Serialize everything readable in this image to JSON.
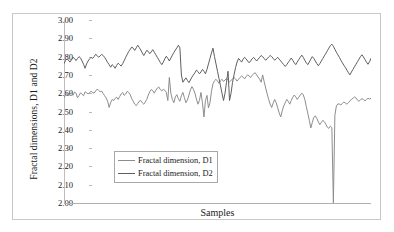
{
  "chart_data": {
    "type": "line",
    "title": "",
    "xlabel": "Samples",
    "ylabel": "Fractal dimensions, D1 and D2",
    "ylim": [
      2.0,
      3.0
    ],
    "ytick_step": 0.1,
    "ytick_labels": [
      "3.00",
      "2.90",
      "2.80",
      "2.70",
      "2.60",
      "2.50",
      "2.40",
      "2.30",
      "2.20",
      "2.10",
      "2.00"
    ],
    "ytick_values": [
      3.0,
      2.9,
      2.8,
      2.7,
      2.6,
      2.5,
      2.4,
      2.3,
      2.2,
      2.1,
      2.0
    ],
    "xtick_labels": [],
    "grid": false,
    "legend_position": "center-left-inside",
    "series": [
      {
        "name": "Fractal dimension, D1",
        "color": "#8d8d8d",
        "values": [
          2.575,
          2.592,
          2.598,
          2.586,
          2.596,
          2.603,
          2.589,
          2.606,
          2.6,
          2.575,
          2.588,
          2.602,
          2.594,
          2.586,
          2.608,
          2.602,
          2.596,
          2.604,
          2.61,
          2.604,
          2.6,
          2.612,
          2.622,
          2.616,
          2.608,
          2.612,
          2.598,
          2.586,
          2.574,
          2.556,
          2.522,
          2.548,
          2.566,
          2.56,
          2.572,
          2.578,
          2.566,
          2.582,
          2.596,
          2.604,
          2.588,
          2.596,
          2.61,
          2.604,
          2.592,
          2.57,
          2.556,
          2.54,
          2.532,
          2.544,
          2.556,
          2.56,
          2.548,
          2.54,
          2.552,
          2.566,
          2.59,
          2.608,
          2.62,
          2.614,
          2.6,
          2.616,
          2.628,
          2.634,
          2.62,
          2.612,
          2.622,
          2.616,
          2.604,
          2.56,
          2.686,
          2.6,
          2.566,
          2.548,
          2.58,
          2.592,
          2.57,
          2.556,
          2.586,
          2.604,
          2.576,
          2.548,
          2.562,
          2.59,
          2.618,
          2.636,
          2.622,
          2.6,
          2.568,
          2.54,
          2.56,
          2.604,
          2.548,
          2.47,
          2.56,
          2.588,
          2.52,
          2.548,
          2.61,
          2.652,
          2.668,
          2.676,
          2.666,
          2.654,
          2.668,
          2.676,
          2.664,
          2.672,
          2.68,
          2.67,
          2.662,
          2.67,
          2.678,
          2.686,
          2.678,
          2.666,
          2.676,
          2.686,
          2.694,
          2.688,
          2.678,
          2.69,
          2.7,
          2.694,
          2.686,
          2.698,
          2.706,
          2.712,
          2.7,
          2.688,
          2.676,
          2.66,
          2.7,
          2.664,
          2.628,
          2.596,
          2.566,
          2.54,
          2.522,
          2.546,
          2.566,
          2.548,
          2.52,
          2.492,
          2.47,
          2.504,
          2.53,
          2.548,
          2.566,
          2.556,
          2.54,
          2.56,
          2.578,
          2.59,
          2.58,
          2.566,
          2.578,
          2.59,
          2.6,
          2.592,
          2.566,
          2.528,
          2.49,
          2.452,
          2.41,
          2.44,
          2.468,
          2.476,
          2.462,
          2.444,
          2.428,
          2.44,
          2.452,
          2.444,
          2.43,
          2.414,
          2.408,
          2.42,
          2.412,
          2.0,
          2.48,
          2.53,
          2.542,
          2.54,
          2.536,
          2.544,
          2.552,
          2.546,
          2.54,
          2.548,
          2.558,
          2.566,
          2.572,
          2.58,
          2.574,
          2.562,
          2.556,
          2.564,
          2.57,
          2.566,
          2.558,
          2.566,
          2.572,
          2.568,
          2.572
        ]
      },
      {
        "name": "Fractal dimension, D2",
        "color": "#5f5f5f",
        "values": [
          2.762,
          2.778,
          2.788,
          2.78,
          2.77,
          2.784,
          2.796,
          2.79,
          2.778,
          2.79,
          2.8,
          2.792,
          2.776,
          2.758,
          2.736,
          2.76,
          2.776,
          2.788,
          2.796,
          2.79,
          2.8,
          2.812,
          2.806,
          2.796,
          2.804,
          2.812,
          2.806,
          2.796,
          2.782,
          2.768,
          2.756,
          2.742,
          2.756,
          2.748,
          2.736,
          2.752,
          2.764,
          2.756,
          2.748,
          2.762,
          2.778,
          2.796,
          2.812,
          2.828,
          2.84,
          2.852,
          2.846,
          2.834,
          2.848,
          2.862,
          2.85,
          2.836,
          2.82,
          2.806,
          2.82,
          2.834,
          2.828,
          2.816,
          2.826,
          2.838,
          2.824,
          2.81,
          2.796,
          2.782,
          2.768,
          2.756,
          2.77,
          2.788,
          2.802,
          2.79,
          2.776,
          2.792,
          2.808,
          2.822,
          2.836,
          2.848,
          2.862,
          2.848,
          2.7,
          2.66,
          2.672,
          2.684,
          2.67,
          2.658,
          2.672,
          2.688,
          2.7,
          2.712,
          2.726,
          2.718,
          2.706,
          2.716,
          2.73,
          2.72,
          2.706,
          2.73,
          2.76,
          2.79,
          2.82,
          2.846,
          2.8,
          2.76,
          2.72,
          2.68,
          2.64,
          2.6,
          2.56,
          2.6,
          2.66,
          2.72,
          2.56,
          2.6,
          2.66,
          2.7,
          2.74,
          2.77,
          2.79,
          2.78,
          2.77,
          2.786,
          2.796,
          2.788,
          2.776,
          2.766,
          2.776,
          2.788,
          2.796,
          2.786,
          2.776,
          2.786,
          2.796,
          2.806,
          2.8,
          2.79,
          2.78,
          2.788,
          2.798,
          2.806,
          2.8,
          2.79,
          2.78,
          2.788,
          2.796,
          2.786,
          2.776,
          2.766,
          2.756,
          2.746,
          2.756,
          2.768,
          2.78,
          2.792,
          2.78,
          2.766,
          2.756,
          2.77,
          2.784,
          2.796,
          2.808,
          2.796,
          2.78,
          2.766,
          2.756,
          2.77,
          2.786,
          2.8,
          2.79,
          2.776,
          2.762,
          2.75,
          2.762,
          2.776,
          2.79,
          2.804,
          2.818,
          2.832,
          2.846,
          2.86,
          2.868,
          2.856,
          2.84,
          2.824,
          2.81,
          2.796,
          2.78,
          2.766,
          2.752,
          2.74,
          2.726,
          2.712,
          2.7,
          2.716,
          2.73,
          2.744,
          2.758,
          2.772,
          2.786,
          2.8,
          2.81,
          2.798,
          2.784,
          2.77,
          2.758,
          2.772,
          2.79
        ]
      }
    ]
  },
  "legend": {
    "items": [
      {
        "label": "Fractal dimension, D1",
        "color": "#8d8d8d"
      },
      {
        "label": "Fractal dimension, D2",
        "color": "#5f5f5f"
      }
    ]
  }
}
